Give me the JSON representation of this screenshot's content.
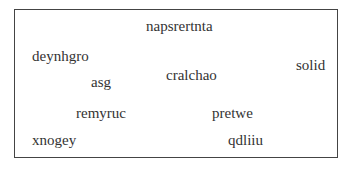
{
  "words": [
    {
      "text": "napsrertnta",
      "x": 146,
      "y": 19
    },
    {
      "text": "deynhgro",
      "x": 32,
      "y": 49
    },
    {
      "text": "solid",
      "x": 296,
      "y": 58
    },
    {
      "text": "cralchao",
      "x": 166,
      "y": 68
    },
    {
      "text": "asg",
      "x": 91,
      "y": 75
    },
    {
      "text": "remyruc",
      "x": 76,
      "y": 106
    },
    {
      "text": "pretwe",
      "x": 212,
      "y": 106
    },
    {
      "text": "xnogey",
      "x": 32,
      "y": 133
    },
    {
      "text": "qdliiu",
      "x": 228,
      "y": 133
    }
  ]
}
